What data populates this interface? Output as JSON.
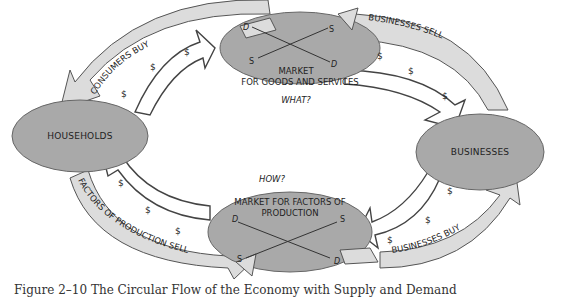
{
  "figure": {
    "caption": "Figure 2–10  The Circular Flow of the Economy with Supply and Demand"
  },
  "colors": {
    "ellipse_fill": "#a9a9a9",
    "outer_arrow_fill": "#dcdcdc",
    "inner_arrow_fill": "#ffffff",
    "stroke": "#555555"
  },
  "nodes": {
    "households": "HOUSEHOLDS",
    "businesses": "BUSINESSES",
    "goods_market": {
      "line1": "MARKET",
      "line2": "FOR GOODS AND SERVICES",
      "question": "WHAT?",
      "demand_start": "D",
      "demand_end": "D",
      "supply_start": "S",
      "supply_end": "S"
    },
    "factor_market": {
      "line1": "MARKET FOR FACTORS OF",
      "line2": "PRODUCTION",
      "question": "HOW?",
      "demand_start": "D",
      "demand_end": "D",
      "supply_start": "S",
      "supply_end": "S"
    }
  },
  "flows": {
    "consumers_buy": "CONSUMERS BUY",
    "businesses_sell": "BUSINESSES SELL",
    "businesses_buy": "BUSINESSES BUY",
    "factors_sell": "FACTORS OF PRODUCTION SELL",
    "money_symbol": "$"
  }
}
